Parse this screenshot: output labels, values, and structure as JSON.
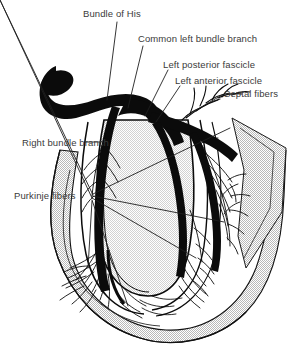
{
  "figure": {
    "background_color": "#ffffff",
    "ink_color": "#000000",
    "text_color": "#3a3a3a",
    "wall_shading_color": "#c8c8c8",
    "width": 298,
    "height": 347
  },
  "labels": {
    "bundle_of_his": "Bundle of His",
    "common_left_bundle_branch": "Common left bundle branch",
    "left_posterior_fascicle": "Left posterior fascicle",
    "left_anterior_fascicle": "Left anterior fascicle",
    "septal_fibers": "Septal fibers",
    "right_bundle_branch": "Right\nbundle branch",
    "purkinje_fibers": "Purkinje fibers"
  },
  "structures": [
    {
      "name": "av-node-bundle-trunk",
      "description": "dark bulb tapering into the bundle of His"
    },
    {
      "name": "right-bundle-branch",
      "description": "thick dark branch descending on the left side of the figure"
    },
    {
      "name": "common-left-bundle-branch",
      "description": "dark branch fanning right into fascicles"
    },
    {
      "name": "left-posterior-fascicle",
      "description": "posterior division of the left bundle"
    },
    {
      "name": "left-anterior-fascicle",
      "description": "anterior division of the left bundle"
    },
    {
      "name": "septal-fibers",
      "description": "fine fiber spray toward the septum"
    },
    {
      "name": "purkinje-fiber-network",
      "description": "feathery terminal fiber networks in both ventricles"
    },
    {
      "name": "ventricular-wall",
      "description": "halftone-shaded myocardial wall forming the apex"
    },
    {
      "name": "interventricular-septum",
      "description": "central shaded septum between ventricles"
    }
  ]
}
